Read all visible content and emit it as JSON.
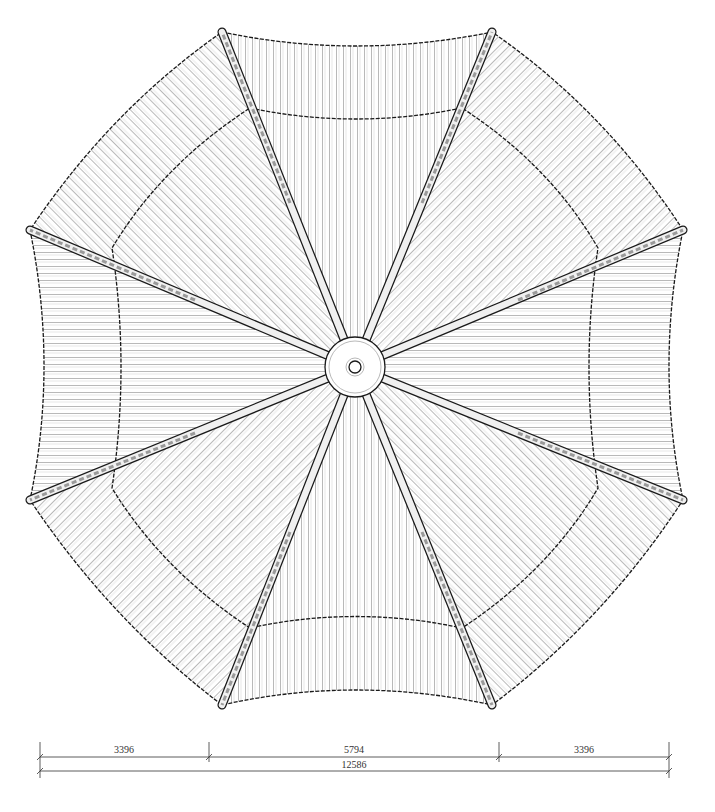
{
  "drawing": {
    "type": "octagonal pavilion roof plan",
    "center": [
      355,
      367
    ],
    "colors": {
      "line": "#1a1a1a",
      "tile": "#8a8a8a",
      "background": "#ffffff",
      "ridge_fill": "#e8e8e8"
    }
  },
  "dimensions": {
    "segments": [
      {
        "label": "3396",
        "x1": 40,
        "x2": 209
      },
      {
        "label": "5794",
        "x1": 209,
        "x2": 499
      },
      {
        "label": "3396",
        "x1": 499,
        "x2": 669
      }
    ],
    "total": {
      "label": "12586",
      "x1": 40,
      "x2": 669
    }
  }
}
